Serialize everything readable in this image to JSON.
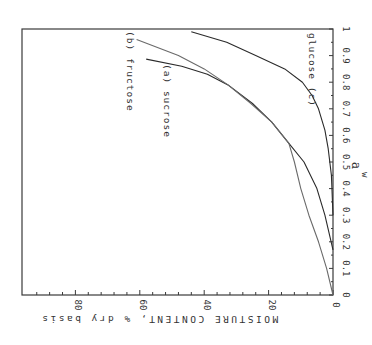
{
  "chart_data": {
    "type": "line",
    "title": "",
    "orientation_note": "figure is rendered rotated 90 degrees clockwise",
    "xlabel": "a_w",
    "ylabel": "MOISTURE CONTENT, % dry basis",
    "xlim": [
      0,
      1
    ],
    "ylim": [
      0,
      90
    ],
    "x_ticks": [
      "0",
      "0.1",
      "0.2",
      "0.3",
      "0.4",
      "0.5",
      "0.6",
      "0.7",
      "0.8",
      "0.9",
      "1"
    ],
    "y_ticks": [
      "0",
      "20",
      "40",
      "60",
      "80"
    ],
    "grid": false,
    "legend": "inline curve labels",
    "series": [
      {
        "name": "(a) sucrose",
        "label": "(a) sucrose",
        "x": [
          0.17,
          0.3,
          0.4,
          0.5,
          0.57,
          0.65,
          0.72,
          0.79,
          0.83,
          0.86,
          0.887
        ],
        "y": [
          0,
          2.5,
          5,
          9,
          13.7,
          19,
          25,
          32.6,
          39,
          47,
          58
        ]
      },
      {
        "name": "(b) fructose",
        "label": "(b) fructose",
        "x": [
          0.0,
          0.1,
          0.2,
          0.3,
          0.4,
          0.5,
          0.57,
          0.65,
          0.72,
          0.79,
          0.85,
          0.9,
          0.96
        ],
        "y": [
          0,
          2,
          4.5,
          7.5,
          10,
          12,
          13.7,
          19,
          25.5,
          32.6,
          40,
          48,
          61
        ]
      },
      {
        "name": "glucose (c)",
        "label": "glucose (c)",
        "x": [
          0.3,
          0.45,
          0.55,
          0.62,
          0.7,
          0.75,
          0.8,
          0.85,
          0.9,
          0.95,
          0.99
        ],
        "y": [
          0,
          0.5,
          1.5,
          2.5,
          4.5,
          6.5,
          9.5,
          15,
          24,
          33,
          44
        ]
      }
    ]
  }
}
